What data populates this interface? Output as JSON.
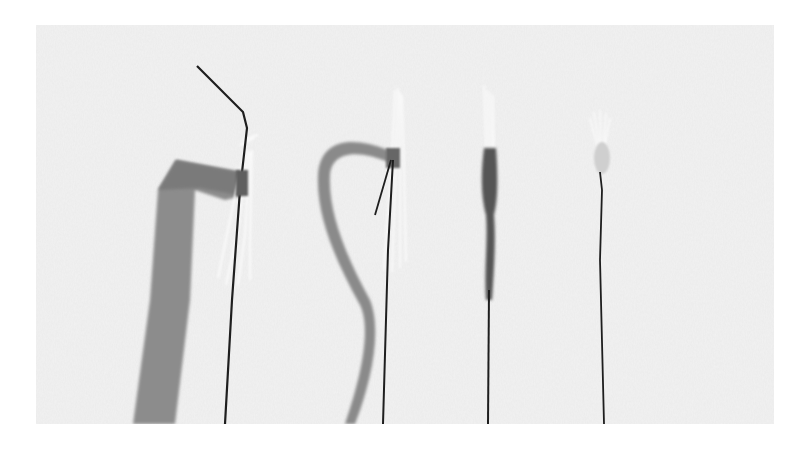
{
  "image": {
    "description": "Grayscale photograph of four craft flower stamen bundles on wire stems, shown in successive stages of being wrapped with floral tape, on a mottled white paper background",
    "subject_count": 4,
    "colors": {
      "canvas": "#ffffff",
      "paper": "#ececec",
      "tape": "#8a8a8a",
      "wire": "#1e1e1e",
      "stamen": "#f4f4f4"
    },
    "subjects": [
      {
        "stage": 1,
        "label": "stamen bundle with bent wire and wide tape strip"
      },
      {
        "stage": 2,
        "label": "stamen bundle with curling tape ribbon"
      },
      {
        "stage": 3,
        "label": "stamen bundle with tape wrapped down stem"
      },
      {
        "stage": 4,
        "label": "finished stamen with smooth wrapped base"
      }
    ]
  }
}
